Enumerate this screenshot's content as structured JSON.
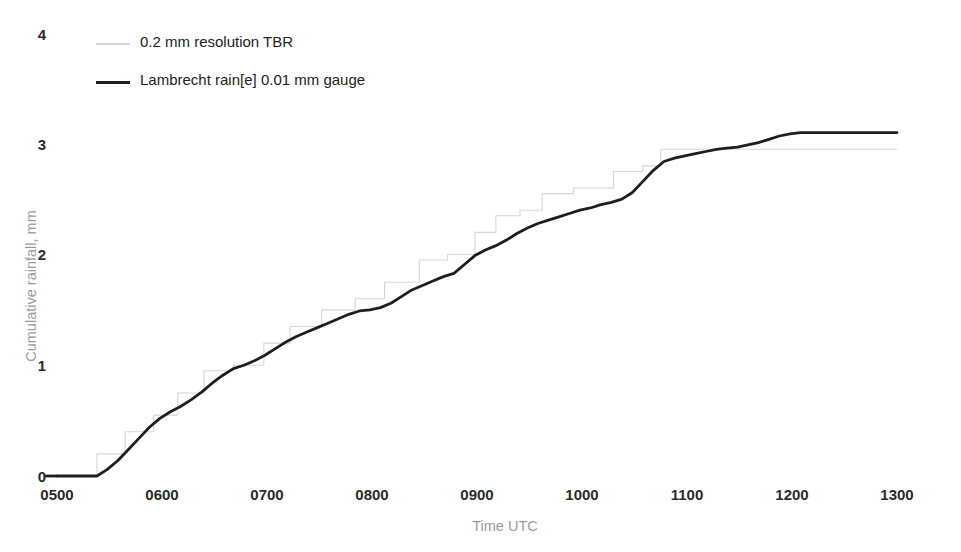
{
  "chart_data": {
    "type": "line",
    "title": "",
    "xlabel": "Time UTC",
    "ylabel": "Cumulative rainfall, mm",
    "xlim": [
      500,
      1300
    ],
    "ylim": [
      0,
      4
    ],
    "xticks": [
      "0500",
      "0600",
      "0700",
      "0800",
      "0900",
      "1000",
      "1100",
      "1200",
      "1300"
    ],
    "yticks": [
      "0",
      "1",
      "2",
      "3",
      "4"
    ],
    "grid": false,
    "legend_position": "top-left",
    "series": [
      {
        "name": "0.2 mm resolution TBR",
        "color": "#d6d6d6",
        "style": "step",
        "x": [
          500,
          538,
          538,
          565,
          565,
          592,
          592,
          615,
          615,
          640,
          640,
          668,
          668,
          697,
          697,
          722,
          722,
          752,
          752,
          784,
          784,
          812,
          812,
          845,
          845,
          872,
          872,
          898,
          898,
          918,
          918,
          941,
          941,
          962,
          962,
          992,
          992,
          1030,
          1030,
          1058,
          1058,
          1075,
          1075,
          1098,
          1098,
          1148,
          1148,
          1300
        ],
        "y": [
          0,
          0,
          0.2,
          0.2,
          0.4,
          0.4,
          0.55,
          0.55,
          0.75,
          0.75,
          0.95,
          0.95,
          1.0,
          1.0,
          1.2,
          1.2,
          1.35,
          1.35,
          1.5,
          1.5,
          1.6,
          1.6,
          1.75,
          1.75,
          1.95,
          1.95,
          2.0,
          2.0,
          2.2,
          2.2,
          2.35,
          2.35,
          2.4,
          2.4,
          2.55,
          2.55,
          2.6,
          2.6,
          2.75,
          2.75,
          2.8,
          2.8,
          2.95,
          2.95,
          2.95,
          2.95,
          2.95,
          2.95
        ]
      },
      {
        "name": "Lambrecht rain[e] 0.01 mm gauge",
        "color": "#1e1e1e",
        "style": "smooth",
        "x": [
          500,
          520,
          538,
          548,
          558,
          568,
          578,
          588,
          598,
          608,
          618,
          628,
          638,
          648,
          658,
          668,
          678,
          688,
          698,
          708,
          718,
          728,
          738,
          748,
          758,
          768,
          778,
          788,
          798,
          808,
          818,
          828,
          838,
          848,
          858,
          868,
          878,
          888,
          898,
          908,
          918,
          928,
          938,
          948,
          958,
          968,
          978,
          988,
          998,
          1008,
          1018,
          1028,
          1038,
          1048,
          1058,
          1068,
          1078,
          1088,
          1098,
          1108,
          1118,
          1128,
          1138,
          1148,
          1158,
          1168,
          1178,
          1188,
          1198,
          1208,
          1230,
          1260,
          1300
        ],
        "y": [
          0.0,
          0.0,
          0.0,
          0.06,
          0.14,
          0.24,
          0.34,
          0.44,
          0.52,
          0.58,
          0.63,
          0.69,
          0.76,
          0.84,
          0.91,
          0.97,
          1.0,
          1.04,
          1.09,
          1.15,
          1.21,
          1.26,
          1.3,
          1.34,
          1.38,
          1.42,
          1.46,
          1.49,
          1.5,
          1.52,
          1.56,
          1.62,
          1.68,
          1.72,
          1.76,
          1.8,
          1.83,
          1.91,
          1.99,
          2.04,
          2.08,
          2.13,
          2.19,
          2.24,
          2.28,
          2.31,
          2.34,
          2.37,
          2.4,
          2.42,
          2.45,
          2.47,
          2.5,
          2.56,
          2.66,
          2.76,
          2.84,
          2.87,
          2.89,
          2.91,
          2.93,
          2.95,
          2.96,
          2.97,
          2.99,
          3.01,
          3.04,
          3.07,
          3.09,
          3.1,
          3.1,
          3.1,
          3.1
        ]
      }
    ]
  },
  "legend": {
    "items": [
      {
        "label": "0.2 mm resolution TBR"
      },
      {
        "label": "Lambrecht rain[e] 0.01 mm gauge"
      }
    ]
  },
  "axes": {
    "y_title": "Cumulative rainfall, mm",
    "x_title": "Time UTC",
    "y_tick_labels": [
      "4",
      "3",
      "2",
      "1",
      "0"
    ],
    "x_tick_labels": [
      "0500",
      "0600",
      "0700",
      "0800",
      "0900",
      "1000",
      "1100",
      "1200",
      "1300"
    ]
  }
}
